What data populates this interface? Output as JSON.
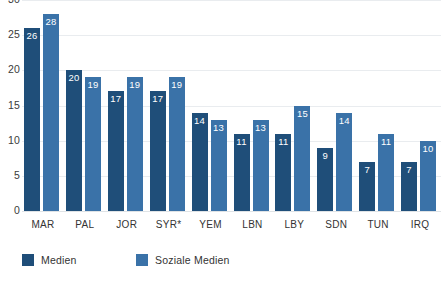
{
  "chart_data": {
    "type": "bar",
    "title": "",
    "subtitle": "",
    "xlabel": "",
    "ylabel": "",
    "ylim": [
      0,
      30
    ],
    "yticks": [
      0,
      5,
      10,
      15,
      20,
      25,
      30
    ],
    "ytick_labels": [
      "0",
      "5",
      "10",
      "15",
      "20",
      "25",
      "30"
    ],
    "grid": true,
    "grid_axis": "y",
    "legend_position": "bottom-left",
    "categories": [
      "MAR",
      "PAL",
      "JOR",
      "SYR*",
      "YEM",
      "LBN",
      "LBY",
      "SDN",
      "TUN",
      "IRQ"
    ],
    "series": [
      {
        "name": "Medien",
        "color": "#1F4E79",
        "values": [
          26,
          20,
          17,
          17,
          14,
          11,
          11,
          9,
          7,
          7
        ]
      },
      {
        "name": "Soziale Medien",
        "color": "#3A72A8",
        "values": [
          28,
          19,
          19,
          19,
          13,
          13,
          15,
          14,
          11,
          10
        ]
      }
    ],
    "data_labels": {
      "shown": true,
      "color": "#FFFFFF",
      "position": "inside-top"
    }
  },
  "legend": {
    "items": [
      {
        "label": "Medien",
        "color": "#1F4E79"
      },
      {
        "label": "Soziale Medien",
        "color": "#3A72A8"
      }
    ]
  },
  "colors": {
    "background": "#FFFFFF",
    "gridline": "#E9ECEF",
    "baseline": "#DFE3E6",
    "axis_text": "#333333",
    "series_1": "#1F4E79",
    "series_2": "#3A72A8",
    "data_label": "#FFFFFF"
  }
}
